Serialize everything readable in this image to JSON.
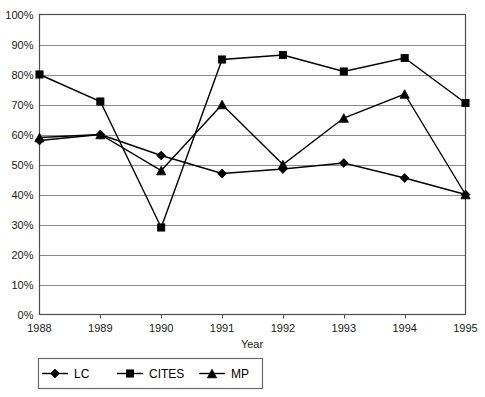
{
  "chart_data": {
    "type": "line",
    "title": "",
    "xlabel": "Year",
    "ylabel": "",
    "x": [
      1988,
      1989,
      1990,
      1991,
      1992,
      1993,
      1994,
      1995
    ],
    "categories": [
      "1988",
      "1989",
      "1990",
      "1991",
      "1992",
      "1993",
      "1994",
      "1995"
    ],
    "series": [
      {
        "name": "LC",
        "marker": "diamond",
        "values": [
          58,
          60,
          53,
          47,
          48.5,
          50.5,
          45.5,
          40
        ]
      },
      {
        "name": "CITES",
        "marker": "square",
        "values": [
          80,
          71,
          29,
          85,
          86.5,
          81,
          85.5,
          70.5
        ]
      },
      {
        "name": "MP",
        "marker": "triangle",
        "values": [
          59,
          60,
          48,
          70,
          50,
          65.5,
          73.5,
          40
        ]
      }
    ],
    "ylim": [
      0,
      100
    ],
    "ytick_values": [
      0,
      10,
      20,
      30,
      40,
      50,
      60,
      70,
      80,
      90,
      100
    ],
    "ytick_labels": [
      "0%",
      "10%",
      "20%",
      "30%",
      "40%",
      "50%",
      "60%",
      "70%",
      "80%",
      "90%",
      "100%"
    ],
    "grid": true,
    "grid_axis": "y",
    "legend_position": "bottom-left",
    "line_color": "#000000",
    "grid_color": "#8a8a8a",
    "frame_color": "#4d4d4d",
    "background_color": "#ffffff"
  },
  "legend": {
    "entries": [
      {
        "label": "LC"
      },
      {
        "label": "CITES"
      },
      {
        "label": "MP"
      }
    ]
  },
  "axes": {
    "x_title": "Year"
  }
}
